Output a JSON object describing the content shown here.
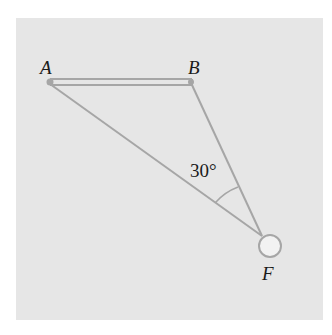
{
  "diagram": {
    "type": "force-triangle",
    "points": {
      "A": {
        "label": "A",
        "x": 50,
        "y": 82
      },
      "B": {
        "label": "B",
        "x": 191,
        "y": 83
      },
      "F": {
        "label": "F",
        "x": 262,
        "y": 236
      }
    },
    "bar": {
      "from": "A",
      "to": "B"
    },
    "strings": [
      {
        "from": "A",
        "to": "F"
      },
      {
        "from": "B",
        "to": "F"
      }
    ],
    "mass": {
      "cx": 270,
      "cy": 246,
      "r": 11
    },
    "angle": {
      "vertex": "F",
      "value": "30°"
    },
    "colors": {
      "background": "#e6e6e6",
      "line": "#a6a6a6",
      "text": "#1a1a1a"
    }
  },
  "labels": {
    "a": "A",
    "b": "B",
    "f": "F",
    "angle": "30°"
  }
}
